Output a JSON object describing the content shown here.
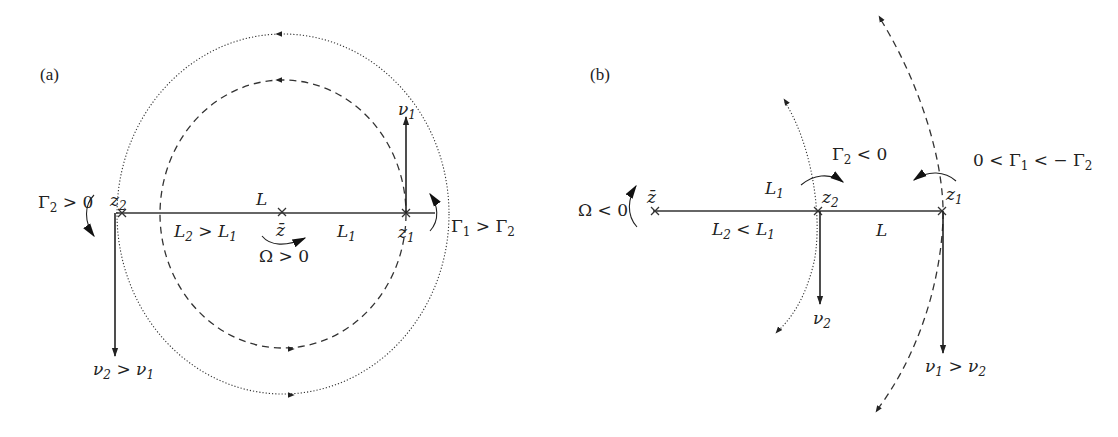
{
  "panels": [
    {
      "id": "a",
      "label": "(a)",
      "points": {
        "z2": {
          "name": "z",
          "sub": "2"
        },
        "zbar": {
          "name": "z̄"
        },
        "z1": {
          "name": "z",
          "sub": "1"
        }
      },
      "segment_labels": {
        "L": "L",
        "left": {
          "a": "L",
          "asub": "2",
          "op": " > ",
          "b": "L",
          "bsub": "1"
        },
        "right": {
          "a": "L",
          "asub": "1"
        }
      },
      "rotation": {
        "sym": "Ω",
        "rel": " > 0"
      },
      "gamma_left": {
        "sym": "Γ",
        "sub": "2",
        "rel": " > 0"
      },
      "gamma_right": {
        "a": "Γ",
        "asub": "1",
        "op": " > ",
        "b": "Γ",
        "bsub": "2"
      },
      "velocity_top": {
        "sym": "ν",
        "sub": "1"
      },
      "velocity_bottom": {
        "a": "ν",
        "asub": "2",
        "op": " > ",
        "b": "ν",
        "bsub": "1"
      }
    },
    {
      "id": "b",
      "label": "(b)",
      "points": {
        "zbar": {
          "name": "z̄"
        },
        "z2": {
          "name": "z",
          "sub": "2"
        },
        "z1": {
          "name": "z",
          "sub": "1"
        }
      },
      "segment_labels": {
        "L1": {
          "a": "L",
          "asub": "1"
        },
        "left": {
          "a": "L",
          "asub": "2",
          "op": " < ",
          "b": "L",
          "bsub": "1"
        },
        "L": "L"
      },
      "rotation": {
        "sym": "Ω",
        "rel": " < 0"
      },
      "gamma_mid": {
        "sym": "Γ",
        "sub": "2",
        "rel": " < 0"
      },
      "gamma_right": {
        "pre": "0 < ",
        "a": "Γ",
        "asub": "1",
        "op": " < − ",
        "b": "Γ",
        "bsub": "2"
      },
      "velocity_mid": {
        "sym": "ν",
        "sub": "2"
      },
      "velocity_right": {
        "a": "ν",
        "asub": "1",
        "op": " > ",
        "b": "ν",
        "bsub": "2"
      }
    }
  ],
  "colors": {
    "ink": "#222222",
    "background": "#ffffff"
  }
}
